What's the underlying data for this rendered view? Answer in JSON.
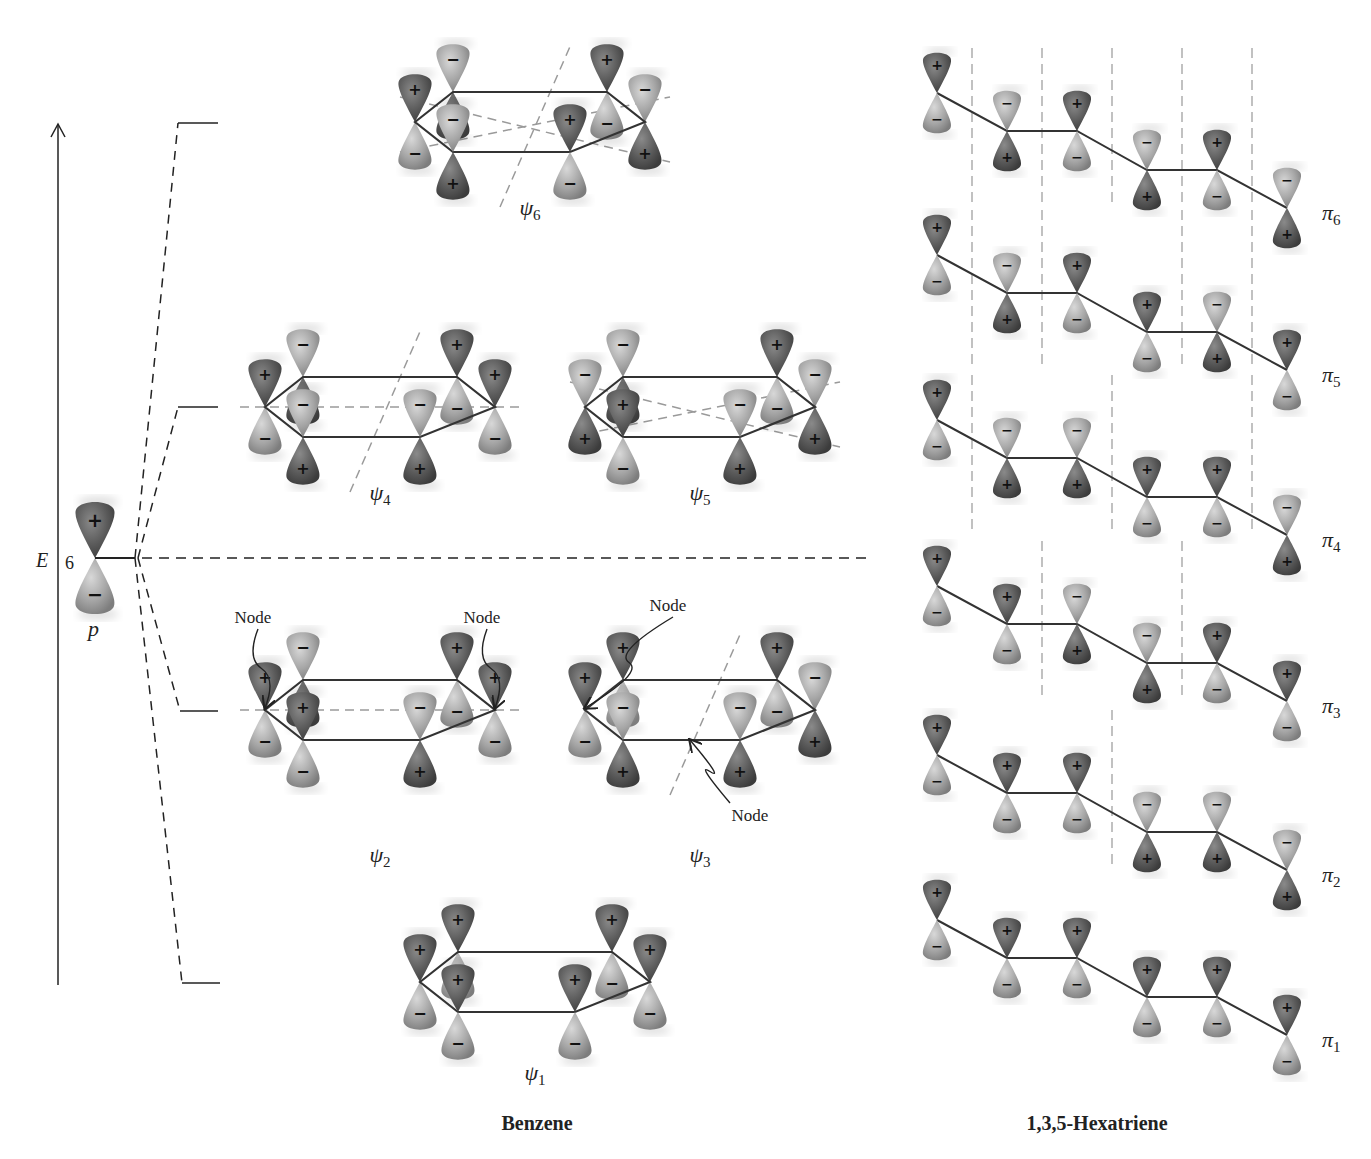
{
  "figure": {
    "title_left": "Benzene",
    "title_right": "1,3,5-Hexatriene"
  },
  "energy_axis": {
    "label": "E",
    "count_label": "6",
    "atomic_orbital_label": "p",
    "atomic_orbital_signs": [
      "+",
      "−"
    ]
  },
  "colors": {
    "plus_lobe": "#5e5e5e",
    "minus_lobe": "#a9a9a9",
    "bond": "#333333",
    "node_line": "#999999",
    "axis": "#222222"
  },
  "energy_levels": [
    {
      "name": "psi6",
      "y": 123
    },
    {
      "name": "psi4-psi5",
      "y": 407
    },
    {
      "name": "p-level",
      "y": 558
    },
    {
      "name": "psi2-psi3",
      "y": 711
    },
    {
      "name": "psi1",
      "y": 983
    }
  ],
  "benzene_mos": [
    {
      "id": "psi6",
      "label": "ψ",
      "subscript": "6",
      "cx": 530,
      "cy": 122,
      "label_y": 215,
      "signs_top": [
        "+",
        "−",
        "+",
        "−",
        "+",
        "−"
      ],
      "nodes": [
        "diag-1",
        "diag-2",
        "diag-3"
      ]
    },
    {
      "id": "psi4",
      "label": "ψ",
      "subscript": "4",
      "cx": 380,
      "cy": 407,
      "label_y": 500,
      "signs_top": [
        "+",
        "−",
        "+",
        "+",
        "−",
        "−"
      ],
      "nodes": [
        "horizontal",
        "diag-1"
      ]
    },
    {
      "id": "psi5",
      "label": "ψ",
      "subscript": "5",
      "cx": 700,
      "cy": 407,
      "label_y": 500,
      "signs_top": [
        "−",
        "−",
        "+",
        "−",
        "−",
        "+"
      ],
      "nodes": [
        "diag-2",
        "diag-3"
      ]
    },
    {
      "id": "psi2",
      "label": "ψ",
      "subscript": "2",
      "cx": 380,
      "cy": 710,
      "label_y": 862,
      "signs_top": [
        "+",
        "−",
        "+",
        "+",
        "−",
        "+"
      ],
      "nodes": [
        "horizontal"
      ],
      "annotations": [
        {
          "text": "Node",
          "x": 253,
          "y": 623
        },
        {
          "text": "Node",
          "x": 482,
          "y": 623
        }
      ]
    },
    {
      "id": "psi3",
      "label": "ψ",
      "subscript": "3",
      "cx": 700,
      "cy": 710,
      "label_y": 862,
      "signs_top": [
        "+",
        "+",
        "+",
        "−",
        "−",
        "−"
      ],
      "nodes": [
        "diag-1"
      ],
      "annotations": [
        {
          "text": "Node",
          "x": 668,
          "y": 611
        },
        {
          "text": "Node",
          "x": 750,
          "y": 821
        }
      ]
    },
    {
      "id": "psi1",
      "label": "ψ",
      "subscript": "1",
      "cx": 535,
      "cy": 982,
      "label_y": 1080,
      "signs_top": [
        "+",
        "+",
        "+",
        "+",
        "+",
        "+"
      ],
      "nodes": []
    }
  ],
  "hexatriene_mos": [
    {
      "id": "pi6",
      "label": "π",
      "subscript": "6",
      "y0": 93,
      "signs_top": [
        "+",
        "−",
        "+",
        "−",
        "+",
        "−"
      ],
      "node_x": [
        972,
        1042,
        1112,
        1182,
        1252
      ]
    },
    {
      "id": "pi5",
      "label": "π",
      "subscript": "5",
      "y0": 255,
      "signs_top": [
        "+",
        "−",
        "+",
        "+",
        "−",
        "+"
      ],
      "node_x": [
        972,
        1042,
        1182,
        1252
      ]
    },
    {
      "id": "pi4",
      "label": "π",
      "subscript": "4",
      "y0": 420,
      "signs_top": [
        "+",
        "−",
        "−",
        "+",
        "+",
        "−"
      ],
      "node_x": [
        972,
        1112,
        1252
      ]
    },
    {
      "id": "pi3",
      "label": "π",
      "subscript": "3",
      "y0": 586,
      "signs_top": [
        "+",
        "+",
        "−",
        "−",
        "+",
        "+"
      ],
      "node_x": [
        1042,
        1182
      ]
    },
    {
      "id": "pi2",
      "label": "π",
      "subscript": "2",
      "y0": 755,
      "signs_top": [
        "+",
        "+",
        "+",
        "−",
        "−",
        "−"
      ],
      "node_x": [
        1112
      ]
    },
    {
      "id": "pi1",
      "label": "π",
      "subscript": "1",
      "y0": 920,
      "signs_top": [
        "+",
        "+",
        "+",
        "+",
        "+",
        "+"
      ],
      "node_x": []
    }
  ]
}
